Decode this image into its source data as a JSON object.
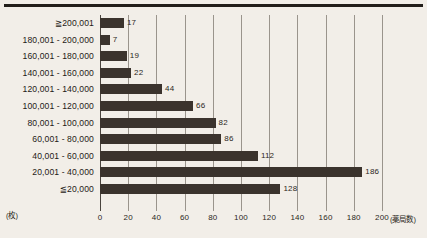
{
  "figure": {
    "background_color": "#f2eee8",
    "bar_color": "#3b332d",
    "gridline_color": "#9a948c",
    "axis_color": "#4a443e"
  },
  "chart_data": {
    "type": "bar",
    "orientation": "horizontal",
    "title": "",
    "xlabel": "(薬局数)",
    "ylabel": "(枚)",
    "xlim": [
      0,
      200
    ],
    "grid": true,
    "legend": "none",
    "xticks": [
      "0",
      "20",
      "40",
      "60",
      "80",
      "100",
      "120",
      "140",
      "160",
      "180",
      "200"
    ],
    "xtick_values": [
      0,
      20,
      40,
      60,
      80,
      100,
      120,
      140,
      160,
      180,
      200
    ],
    "categories": [
      "≧200,001",
      "180,001 - 200,000",
      "160,001 - 180,000",
      "140,001 - 160,000",
      "120,001 - 140,000",
      "100,001 - 120,000",
      "80,001 - 100,000",
      "60,001 - 80,000",
      "40,001 - 60,000",
      "20,001 - 40,000",
      "≦20,000"
    ],
    "values": [
      17,
      7,
      19,
      22,
      44,
      66,
      82,
      86,
      112,
      186,
      128
    ],
    "value_labels": [
      "17",
      "7",
      "19",
      "22",
      "44",
      "66",
      "82",
      "86",
      "112",
      "186",
      "128"
    ]
  }
}
